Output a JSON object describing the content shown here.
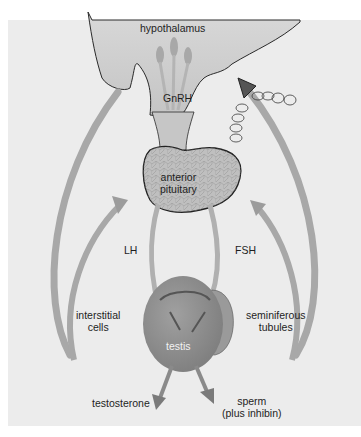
{
  "diagram": {
    "type": "hormonal-regulation",
    "colors": {
      "background": "#ffffff",
      "panel": "#ececec",
      "hypothalamus": "#cfcfcf",
      "pituitary": "#bdbdbd",
      "testis": "#8e8e8e",
      "arrow": "#a8a8a8",
      "outline": "#2a2a2a",
      "text": "#1e1e1e"
    },
    "labels": {
      "hypothalamus": "hypothalamus",
      "gnrh": "GnRH",
      "anterior_pituitary_line1": "anterior",
      "anterior_pituitary_line2": "pituitary",
      "lh": "LH",
      "fsh": "FSH",
      "interstitial_line1": "interstitial",
      "interstitial_line2": "cells",
      "seminiferous_line1": "seminiferous",
      "seminiferous_line2": "tubules",
      "testis": "testis",
      "testosterone": "testosterone",
      "sperm_line1": "sperm",
      "sperm_line2": "(plus inhibin)"
    },
    "nodes": [
      {
        "id": "hypothalamus",
        "label": "hypothalamus"
      },
      {
        "id": "anterior-pituitary",
        "label": "anterior pituitary"
      },
      {
        "id": "testis",
        "label": "testis"
      },
      {
        "id": "interstitial-cells",
        "label": "interstitial cells"
      },
      {
        "id": "seminiferous-tubules",
        "label": "seminiferous tubules"
      }
    ],
    "edges": [
      {
        "from": "hypothalamus",
        "to": "anterior-pituitary",
        "label": "GnRH"
      },
      {
        "from": "anterior-pituitary",
        "to": "interstitial-cells",
        "label": "LH"
      },
      {
        "from": "anterior-pituitary",
        "to": "seminiferous-tubules",
        "label": "FSH"
      },
      {
        "from": "interstitial-cells",
        "to": "output",
        "label": "testosterone"
      },
      {
        "from": "seminiferous-tubules",
        "to": "output",
        "label": "sperm (plus inhibin)"
      },
      {
        "from": "testosterone",
        "to": "hypothalamus",
        "label": "negative feedback"
      },
      {
        "from": "testosterone",
        "to": "anterior-pituitary",
        "label": "negative feedback"
      },
      {
        "from": "inhibin",
        "to": "hypothalamus",
        "label": "negative feedback"
      },
      {
        "from": "inhibin",
        "to": "anterior-pituitary",
        "label": "negative feedback"
      }
    ]
  }
}
